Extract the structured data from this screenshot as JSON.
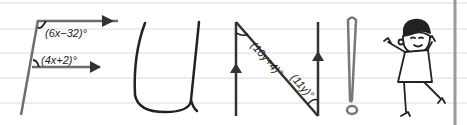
{
  "word": "FUN!",
  "colors": {
    "background": "#ffffff",
    "ruled_line": "#dcdcdc",
    "margin_line": "#9a9a9a",
    "ink": "#222222",
    "stroke_gray": "#6e6e6e"
  },
  "letters": {
    "F": {
      "top_angle_label": "(6x−32)°",
      "bottom_angle_label": "(4x+2)°"
    },
    "U": {},
    "N": {
      "left_angle_label": "(10y+4)°",
      "right_angle_label": "(11y)°"
    },
    "exclamation": {}
  },
  "character": {
    "description": "cheerful cartoon kid jumping"
  }
}
